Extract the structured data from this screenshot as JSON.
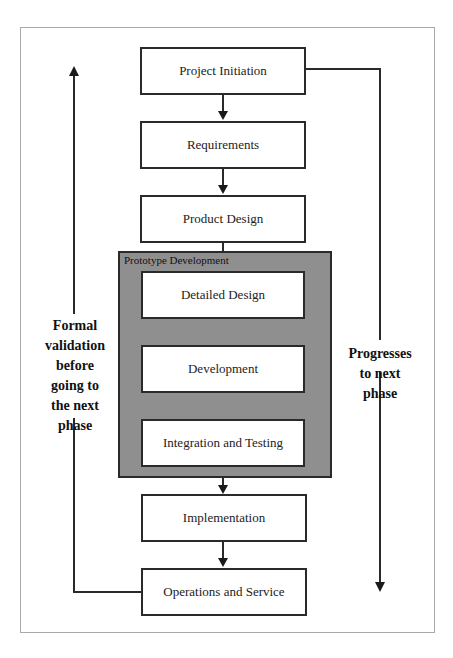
{
  "diagram": {
    "steps": [
      {
        "label": "Project Initiation"
      },
      {
        "label": "Requirements"
      },
      {
        "label": "Product Design"
      },
      {
        "label": "Detailed Design"
      },
      {
        "label": "Development"
      },
      {
        "label": "Integration and Testing"
      },
      {
        "label": "Implementation"
      },
      {
        "label": "Operations and Service"
      }
    ],
    "group": {
      "label": "Prototype Development"
    },
    "left_label": "Formal validation before going to the next phase",
    "right_label": "Progresses to next phase",
    "colors": {
      "group_fill": "#8f8f8f",
      "line": "#2a2a2a",
      "frame": "#aaaaaa"
    }
  }
}
